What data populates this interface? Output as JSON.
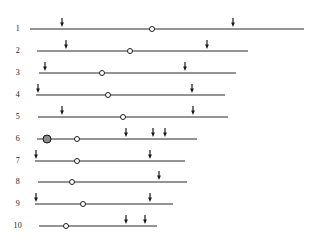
{
  "figure": {
    "width": 318,
    "height": 241,
    "background_color": "#ffffff",
    "line_color": "#2b2b2b",
    "marker_open_fill": "#ffffff",
    "marker_open_stroke": "#1f1f1f",
    "marker_filled_fill": "#8c8c8c",
    "marker_filled_stroke": "#141414",
    "arrow_color": "#1a1a1a",
    "label_color": "#1a1a1a"
  },
  "chart_data": {
    "type": "scatter",
    "title": "",
    "subtitle": "",
    "xlabel": "",
    "ylabel": "",
    "grid": false,
    "legend": "none",
    "xlim": [
      0,
      318
    ],
    "ylim": [
      0,
      241
    ],
    "categories": [
      "1",
      "2",
      "3",
      "4",
      "5",
      "6",
      "7",
      "8",
      "9",
      "10"
    ],
    "series": [
      {
        "name": "line_start_x",
        "values": [
          30,
          37,
          39,
          36,
          38,
          37,
          35,
          38,
          35,
          39
        ]
      },
      {
        "name": "line_end_x",
        "values": [
          304,
          248,
          236,
          225,
          228,
          197,
          185,
          187,
          173,
          157
        ]
      },
      {
        "name": "line_length",
        "values": [
          274,
          211,
          197,
          189,
          190,
          160,
          150,
          149,
          138,
          118
        ]
      },
      {
        "name": "open_circle_x",
        "values": [
          152,
          130,
          102,
          108,
          123,
          77,
          77,
          72,
          83,
          66
        ]
      },
      {
        "name": "arrow_count",
        "values": [
          2,
          2,
          2,
          2,
          2,
          3,
          2,
          1,
          2,
          2
        ]
      }
    ],
    "rows": [
      {
        "label": "1",
        "label_x": 20,
        "y": 29,
        "line_start": 30,
        "line_end": 304,
        "open_circle": 152,
        "filled_circle": null,
        "arrows": [
          62,
          233
        ]
      },
      {
        "label": "2",
        "label_x": 20,
        "y": 51,
        "line_start": 37,
        "line_end": 248,
        "open_circle": 130,
        "filled_circle": null,
        "arrows": [
          66,
          207
        ]
      },
      {
        "label": "3",
        "label_x": 20,
        "y": 73,
        "line_start": 39,
        "line_end": 236,
        "open_circle": 102,
        "filled_circle": null,
        "arrows": [
          45,
          185
        ]
      },
      {
        "label": "4",
        "label_x": 20,
        "y": 95,
        "line_start": 36,
        "line_end": 225,
        "open_circle": 108,
        "filled_circle": null,
        "arrows": [
          38,
          192
        ]
      },
      {
        "label": "5",
        "label_x": 20,
        "y": 117,
        "line_start": 38,
        "line_end": 228,
        "open_circle": 123,
        "filled_circle": null,
        "arrows": [
          62,
          193
        ]
      },
      {
        "label": "6",
        "label_x": 20,
        "y": 139,
        "line_start": 37,
        "line_end": 197,
        "open_circle": 77,
        "filled_circle": 47,
        "arrows": [
          126,
          153,
          165
        ]
      },
      {
        "label": "7",
        "label_x": 20,
        "y": 161,
        "line_start": 35,
        "line_end": 185,
        "open_circle": 77,
        "filled_circle": null,
        "arrows": [
          36,
          150
        ]
      },
      {
        "label": "8",
        "label_x": 20,
        "y": 182,
        "line_start": 38,
        "line_end": 187,
        "open_circle": 72,
        "filled_circle": null,
        "arrows": [
          159
        ]
      },
      {
        "label": "9",
        "label_x": 20,
        "y": 204,
        "line_start": 35,
        "line_end": 173,
        "open_circle": 83,
        "filled_circle": null,
        "arrows": [
          36,
          150
        ]
      },
      {
        "label": "10",
        "label_x": 22,
        "y": 226,
        "line_start": 39,
        "line_end": 157,
        "open_circle": 66,
        "filled_circle": null,
        "arrows": [
          126,
          145
        ]
      }
    ]
  }
}
